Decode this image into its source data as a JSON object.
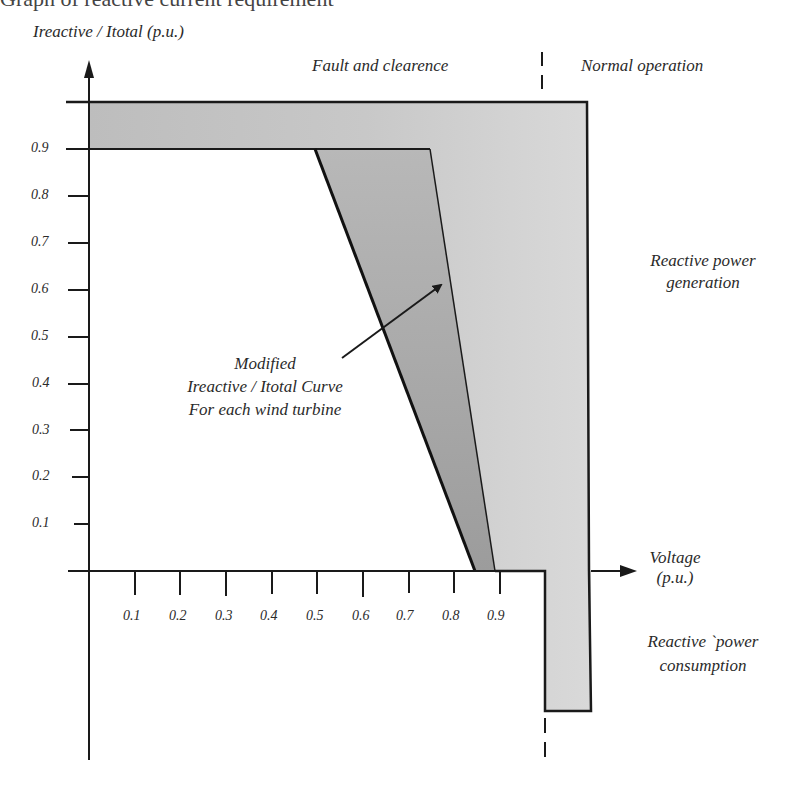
{
  "header": {
    "clipped_caption": "Graph of reactive current requirement"
  },
  "axes": {
    "y_label": "Ireactive / Itotal  (p.u.)",
    "x_label_line1": "Voltage",
    "x_label_line2": "(p.u.)",
    "y_ticks": [
      "0.9",
      "0.8",
      "0.7",
      "0.6",
      "0.5",
      "0.4",
      "0.3",
      "0.2",
      "0.1"
    ],
    "x_ticks": [
      "0.1",
      "0.2",
      "0.3",
      "0.4",
      "0.5",
      "0.6",
      "0.7",
      "0.8",
      "0.9"
    ]
  },
  "regions": {
    "fault": "Fault and clearence",
    "normal": "Normal operation",
    "generation_line1": "Reactive power",
    "generation_line2": "generation",
    "consumption_line1": "Reactive `power",
    "consumption_line2": "consumption"
  },
  "annotation": {
    "line1": "Modified",
    "line2": "Ireactive / Itotal  Curve",
    "line3": "For each wind turbine"
  },
  "colors": {
    "outer_band": "#d4d4d4",
    "inner_band": "#a9a9a9",
    "line": "#1a1a1a"
  }
}
